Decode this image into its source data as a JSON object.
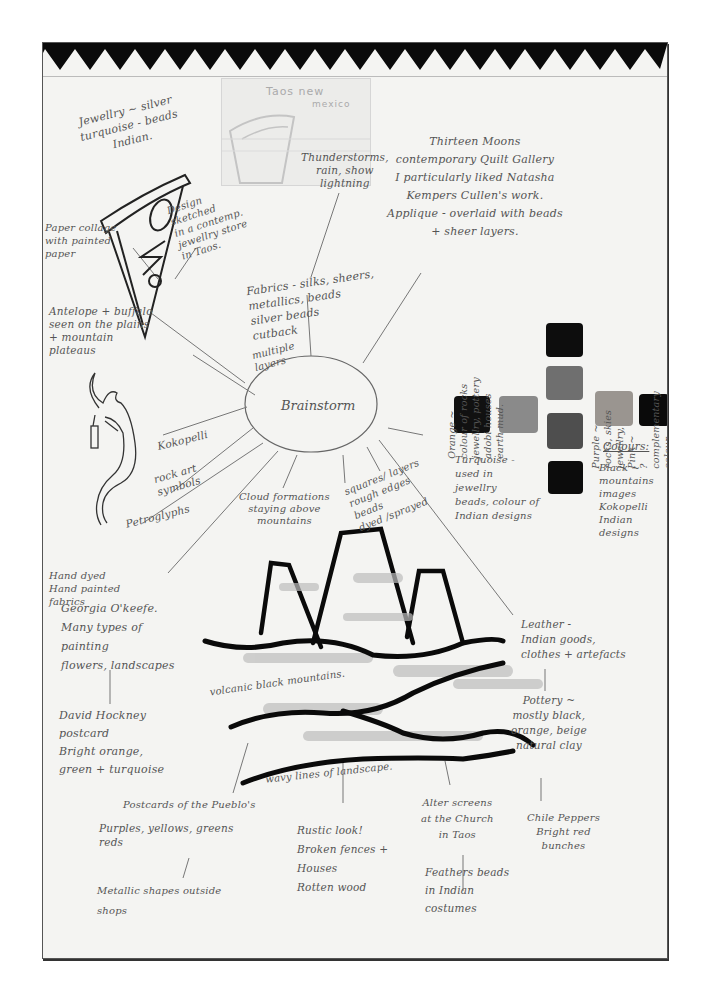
{
  "page": {
    "center_label": "Brainstorm",
    "border_color": "#555555",
    "paper_color": "#f4f4f2",
    "ink_color": "#555555"
  },
  "taos_sketch": {
    "title": "Taos new",
    "subtitle": "mexico"
  },
  "notes": {
    "jewellery": "Jewellry ~ silver\nturquoise - beads\nIndian.",
    "design_sketched": "Design\nsketched\nin a contemp.\njewellry store\nin Taos.",
    "paper_collage": "Paper collage\nwith painted\npaper",
    "thunderstorms": "Thunderstorms,\nrain, show\nlightning",
    "thirteen_moons": "Thirteen Moons\ncontemporary Quilt Gallery\nI particularly liked Natasha\nKempers Cullen's work.\nApplique - overlaid with beads\n+ sheer layers.",
    "fabrics": "Fabrics - silks, sheers,\nmetallics, beads\nsilver beads\ncutback",
    "multiple_layers": "multiple\nlayers",
    "antelope": "Antelope + buffalo\nseen on the plains\n+ mountain\nplateaus",
    "kokopelli": "Kokopelli",
    "rock_art": "rock art\nsymbols",
    "petroglyphs": "Petroglyphs",
    "orange": "Orange ~\ncolour of rocks\njewellry, pottery\nadobi houses\nearth mud.",
    "purple": "Purple ~\nrocks, skies\njewellry,\nPink ~\n? complementary\ncolour",
    "turquoise": "Turquoise -\nused in\njewellry\nbeads, colour of\nIndian designs",
    "colours_heading": "Colours:",
    "black": "Black ~\nmountains\nimages\nKokopelli\nIndian\ndesigns",
    "cloud": "Cloud formations\nstaying above\nmountains",
    "squares": "squares/ layers\nrough edges\nbeads\ndyed /sprayed",
    "hand_dyed": "Hand dyed\nHand painted\nfabrics",
    "georgia": "Georgia O'keefe.\nMany types of\npainting\nflowers, landscapes",
    "hockney": "David Hockney\npostcard\nBright orange,\ngreen + turquoise",
    "volcanic": "volcanic black mountains.",
    "wavy": "wavy lines of landscape.",
    "leather": "Leather -\nIndian goods,\nclothes + artefacts",
    "pottery": "Pottery ~\nmostly black,\norange, beige\nnatural clay",
    "chile": "Chile Peppers\nBright red\nbunches",
    "pueblos": "Postcards of the Pueblo's",
    "purples_yellows": "Purples, yellows, greens\nreds",
    "metallic": "Metallic shapes outside\nshops",
    "rustic": "Rustic look!\nBroken fences +\nHouses\nRotten wood",
    "alter": "Alter screens\nat the Church\nin Taos",
    "feathers": "Feathers beads\nin Indian\ncostumes"
  },
  "swatches": [
    {
      "name": "black-1",
      "color": "#111111"
    },
    {
      "name": "grey",
      "color": "#8a8a8a"
    },
    {
      "name": "black-top",
      "color": "#0d0d0d"
    },
    {
      "name": "mid-grey",
      "color": "#6f6f6f"
    },
    {
      "name": "dark-grey",
      "color": "#4e4e4e"
    },
    {
      "name": "black-bottom",
      "color": "#0c0c0c"
    },
    {
      "name": "tan-purple",
      "color": "#9a9590"
    },
    {
      "name": "black-right",
      "color": "#0a0a0a"
    }
  ]
}
